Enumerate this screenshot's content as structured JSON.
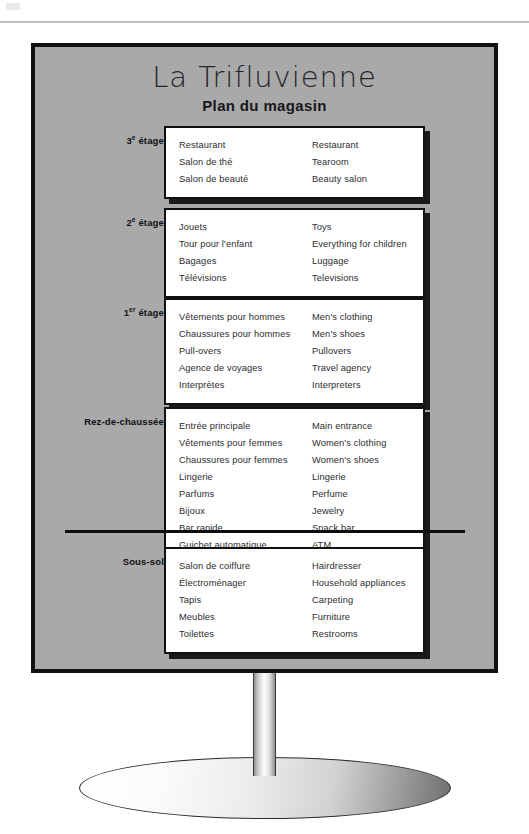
{
  "sign": {
    "title": "La Trifluvienne",
    "subtitle": "Plan du magasin",
    "panel_color": "#a9a9a9",
    "border_color": "#111111",
    "box_color": "#ffffff",
    "floors": [
      {
        "id": "third-floor",
        "label_number": "3",
        "label_ordinal": "e",
        "label_word": "étage",
        "label_full": "3e étage",
        "entries": [
          {
            "fr": "Restaurant",
            "en": "Restaurant"
          },
          {
            "fr": "Salon de thé",
            "en": "Tearoom"
          },
          {
            "fr": "Salon de beauté",
            "en": "Beauty salon"
          }
        ]
      },
      {
        "id": "second-floor",
        "label_number": "2",
        "label_ordinal": "e",
        "label_word": "étage",
        "label_full": "2e étage",
        "entries": [
          {
            "fr": "Jouets",
            "en": "Toys"
          },
          {
            "fr": "Tour pour l'enfant",
            "en": "Everything for children"
          },
          {
            "fr": "Bagages",
            "en": "Luggage"
          },
          {
            "fr": "Télévisions",
            "en": "Televisions"
          }
        ]
      },
      {
        "id": "first-floor",
        "label_number": "1",
        "label_ordinal": "er",
        "label_word": "étage",
        "label_full": "1er étage",
        "entries": [
          {
            "fr": "Vêtements pour hommes",
            "en": "Men's clothing"
          },
          {
            "fr": "Chaussures pour hommes",
            "en": "Men's shoes"
          },
          {
            "fr": "Pull-overs",
            "en": "Pullovers"
          },
          {
            "fr": "Agence de voyages",
            "en": "Travel agency"
          },
          {
            "fr": "Interprètes",
            "en": "Interpreters"
          }
        ]
      },
      {
        "id": "ground-floor",
        "label_number": "",
        "label_ordinal": "",
        "label_word": "Rez-de-chaussée",
        "label_full": "Rez-de-chaussée",
        "entries": [
          {
            "fr": "Entrée principale",
            "en": "Main entrance"
          },
          {
            "fr": "Vêtements pour femmes",
            "en": "Women's clothing"
          },
          {
            "fr": "Chaussures pour femmes",
            "en": "Women's shoes"
          },
          {
            "fr": "Lingerie",
            "en": "Lingerie"
          },
          {
            "fr": "Parfums",
            "en": "Perfume"
          },
          {
            "fr": "Bijoux",
            "en": "Jewelry"
          },
          {
            "fr": "Bar rapide",
            "en": "Snack bar"
          },
          {
            "fr": "Guichet automatique",
            "en": "ATM"
          }
        ]
      },
      {
        "id": "basement",
        "label_number": "",
        "label_ordinal": "",
        "label_word": "Sous-sol",
        "label_full": "Sous-sol",
        "entries": [
          {
            "fr": "Salon de coiffure",
            "en": "Hairdresser"
          },
          {
            "fr": "Électroménager",
            "en": "Household appliances"
          },
          {
            "fr": "Tapis",
            "en": "Carpeting"
          },
          {
            "fr": "Meubles",
            "en": "Furniture"
          },
          {
            "fr": "Toilettes",
            "en": "Restrooms"
          }
        ]
      }
    ]
  }
}
